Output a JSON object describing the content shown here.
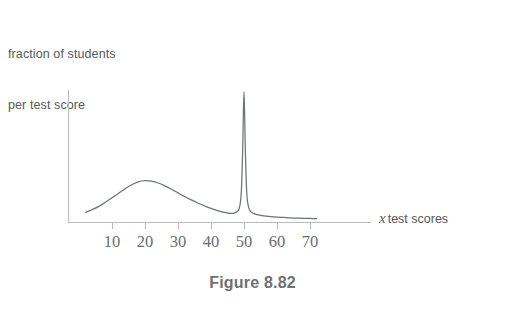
{
  "figure": {
    "caption": "Figure 8.82",
    "y_axis_caption_line1": "fraction of students",
    "y_axis_caption_line2": "per test score",
    "x_axis_var": "x",
    "x_axis_label": "test scores",
    "axis_color": "#b9bbbd",
    "curve_color": "#6f7376",
    "text_color": "#55585b",
    "caption_color": "#6e7174",
    "tick_label_color": "#6a6d70",
    "background_color": "#ffffff"
  },
  "chart_data": {
    "type": "line",
    "title": "Figure 8.82",
    "xlabel": "x test scores",
    "ylabel": "fraction of students per test score",
    "grid": false,
    "legend": "none",
    "xlim": [
      0,
      75
    ],
    "ylim": [
      0,
      1
    ],
    "xticks": [
      10,
      20,
      30,
      40,
      50,
      60,
      70
    ],
    "xtick_labels": [
      "10",
      "20",
      "30",
      "40",
      "50",
      "60",
      "70"
    ],
    "yticks": [],
    "ytick_labels": [],
    "annotations": [
      {
        "text": "broad hump peak",
        "x": 20,
        "y": 0.32
      },
      {
        "text": "narrow spike peak",
        "x": 50,
        "y": 1.0
      }
    ],
    "series": [
      {
        "name": "fraction of students per test score",
        "x": [
          2,
          4,
          6,
          8,
          10,
          12,
          14,
          16,
          18,
          20,
          22,
          24,
          26,
          28,
          30,
          32,
          34,
          36,
          38,
          40,
          42,
          44,
          45,
          46,
          47,
          48,
          48.5,
          49,
          49.3,
          49.6,
          49.8,
          50,
          50.2,
          50.4,
          50.7,
          51,
          51.5,
          52,
          53,
          54,
          56,
          58,
          60,
          62,
          64,
          66,
          68,
          70,
          72
        ],
        "y": [
          0.075,
          0.095,
          0.12,
          0.152,
          0.186,
          0.222,
          0.256,
          0.287,
          0.309,
          0.318,
          0.314,
          0.3,
          0.278,
          0.252,
          0.224,
          0.196,
          0.17,
          0.146,
          0.124,
          0.105,
          0.088,
          0.074,
          0.069,
          0.066,
          0.068,
          0.082,
          0.1,
          0.17,
          0.3,
          0.56,
          0.82,
          1.0,
          0.82,
          0.56,
          0.3,
          0.17,
          0.105,
          0.082,
          0.064,
          0.056,
          0.047,
          0.042,
          0.038,
          0.035,
          0.032,
          0.03,
          0.028,
          0.027,
          0.026
        ]
      }
    ]
  },
  "ticks": [
    {
      "value": "10",
      "px": 112
    },
    {
      "value": "20",
      "px": 145
    },
    {
      "value": "30",
      "px": 178
    },
    {
      "value": "40",
      "px": 211
    },
    {
      "value": "50",
      "px": 244
    },
    {
      "value": "60",
      "px": 277
    },
    {
      "value": "70",
      "px": 310
    }
  ]
}
